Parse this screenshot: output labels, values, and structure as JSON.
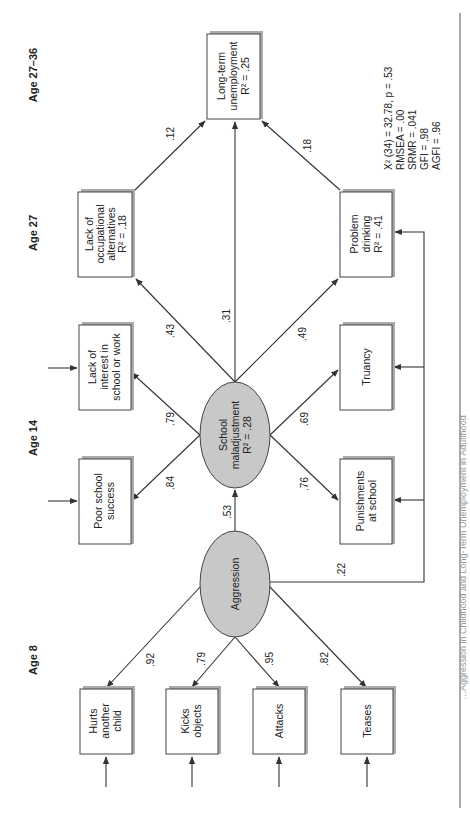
{
  "diagram": {
    "type": "structural-equation-model",
    "orientation": "rotated-90-ccw",
    "age_labels": [
      "Age 8",
      "Age 14",
      "Age 27",
      "Age 27–36"
    ],
    "latent": {
      "aggression": {
        "label": "Aggression"
      },
      "school_maladjustment": {
        "line1": "School",
        "line2": "maladjustment",
        "line3": "R² = .28"
      }
    },
    "indicators_age8": [
      {
        "line1": "Hurts",
        "line2": "another",
        "line3": "child",
        "loading": ".92"
      },
      {
        "line1": "Kicks",
        "line2": "objects",
        "line3": "",
        "loading": ".79"
      },
      {
        "line1": "Attacks",
        "line2": "",
        "line3": "",
        "loading": ".95"
      },
      {
        "line1": "Teases",
        "line2": "",
        "line3": "",
        "loading": ".82"
      }
    ],
    "indicators_age14": [
      {
        "line1": "Poor school",
        "line2": "success",
        "line3": "",
        "loading": ".84"
      },
      {
        "line1": "Lack of",
        "line2": "interest in",
        "line3": "school or work",
        "loading": ".79"
      },
      {
        "line1": "Truancy",
        "line2": "",
        "line3": "",
        "loading": ".69"
      },
      {
        "line1": "Punishments",
        "line2": "at school",
        "line3": "",
        "loading": ".76"
      }
    ],
    "outcomes_age27": [
      {
        "line1": "Lack of",
        "line2": "occupational",
        "line3": "alternatives",
        "line4": "R² = .18",
        "path_from_school": ".43"
      },
      {
        "line1": "Problem",
        "line2": "drinking",
        "line3": "R² = .41",
        "path_from_school": ".49"
      }
    ],
    "outcome_final": {
      "line1": "Long-term",
      "line2": "unemployment",
      "line3": "R² = .25"
    },
    "paths": {
      "aggression_to_school": ".53",
      "aggression_to_drinking": ".22",
      "school_to_unemployment": ".31",
      "occupational_to_unemployment": ".12",
      "drinking_to_unemployment": ".18"
    },
    "fit_indices": [
      "X² (34) = 32.78, p = .53",
      "RMSEA = .00",
      "SRMR = .041",
      "GFI = .98",
      "AGFI = .96"
    ],
    "caption_fragment": "…Aggression in Childhood and Long-Term Unemployment in Adulthood"
  }
}
